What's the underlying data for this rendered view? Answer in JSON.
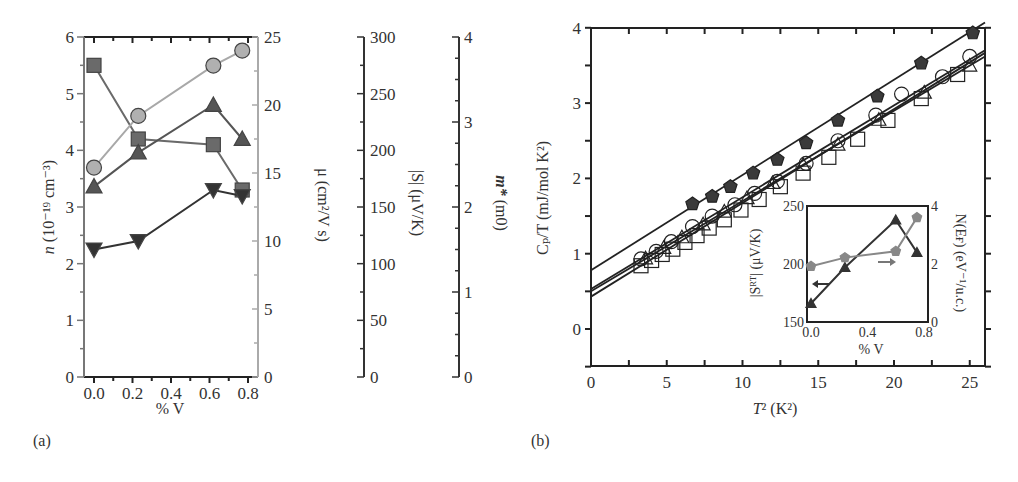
{
  "chart_data": [
    {
      "panel": "(a)",
      "type": "line",
      "xlabel": "% V",
      "x_ticks": [
        "0.0",
        "0.2",
        "0.4",
        "0.6",
        "0.8"
      ],
      "xlim": [
        -0.05,
        0.83
      ],
      "axes": [
        {
          "name": "n",
          "label": "n (10⁻¹⁹ cm⁻³)",
          "ylim": [
            0,
            6
          ],
          "ticks": [
            "0",
            "1",
            "2",
            "3",
            "4",
            "5",
            "6"
          ],
          "color": "#555555"
        },
        {
          "name": "mu",
          "label": "μ (cm²/V s)",
          "ylim": [
            0,
            25
          ],
          "ticks": [
            "0",
            "5",
            "10",
            "15",
            "20",
            "25"
          ],
          "color": "#999999"
        },
        {
          "name": "S",
          "label": "|S| (μV/K)",
          "ylim": [
            0,
            300
          ],
          "ticks": [
            "0",
            "50",
            "100",
            "150",
            "200",
            "250",
            "300"
          ],
          "color": "#333333"
        },
        {
          "name": "m_eff",
          "label": "m* (m0)",
          "ylim": [
            0,
            4
          ],
          "ticks": [
            "0",
            "1",
            "2",
            "3",
            "4"
          ],
          "color": "#333333"
        }
      ],
      "series": [
        {
          "name": "n (squares)",
          "marker": "square",
          "color": "#6a6a6a",
          "axis": "n",
          "x": [
            0.0,
            0.23,
            0.62,
            0.77
          ],
          "values": [
            5.5,
            4.2,
            4.1,
            3.3
          ]
        },
        {
          "name": "mu (circles)",
          "marker": "circle",
          "color": "#a8a8a8",
          "axis": "mu",
          "x": [
            0.0,
            0.23,
            0.62,
            0.77
          ],
          "values": [
            15.4,
            19.2,
            22.9,
            24.0
          ]
        },
        {
          "name": "|S| (up triangles)",
          "marker": "triangle-up",
          "color": "#555555",
          "axis": "S",
          "x": [
            0.0,
            0.23,
            0.62,
            0.77
          ],
          "values": [
            168,
            198,
            240,
            210
          ]
        },
        {
          "name": "m* (down triangles)",
          "marker": "triangle-down",
          "color": "#333333",
          "axis": "m_eff",
          "x": [
            0.0,
            0.23,
            0.62,
            0.77
          ],
          "values": [
            1.5,
            1.6,
            2.2,
            2.13
          ]
        }
      ]
    },
    {
      "panel": "(b)",
      "type": "scatter",
      "xlabel": "T² (K²)",
      "ylabel": "Cₚ/T (mJ/mol K²)",
      "xlim": [
        0,
        26
      ],
      "ylim": [
        -0.5,
        4
      ],
      "x_ticks": [
        "0",
        "5",
        "10",
        "15",
        "20",
        "25"
      ],
      "y_ticks": [
        "0",
        "1",
        "2",
        "3",
        "4"
      ],
      "series": [
        {
          "name": "filled pentagons",
          "marker": "pentagon-filled",
          "color": "#333333",
          "fit": {
            "intercept": 0.78,
            "slope": 0.1265
          },
          "x": [
            6.7,
            8.0,
            9.2,
            10.7,
            12.3,
            14.2,
            16.3,
            18.9,
            21.8,
            25.2
          ],
          "values": [
            1.66,
            1.76,
            1.89,
            2.07,
            2.25,
            2.47,
            2.77,
            3.09,
            3.53,
            3.93
          ]
        },
        {
          "name": "open circles",
          "marker": "circle-open",
          "color": "#222222",
          "fit": {
            "intercept": 0.53,
            "slope": 0.122
          },
          "x": [
            3.3,
            4.3,
            5.3,
            6.7,
            8.0,
            9.5,
            10.8,
            12.3,
            14.2,
            16.3,
            18.8,
            20.5,
            23.2,
            25.0
          ],
          "values": [
            0.93,
            1.03,
            1.16,
            1.36,
            1.5,
            1.65,
            1.8,
            1.96,
            2.2,
            2.5,
            2.84,
            3.12,
            3.35,
            3.62
          ]
        },
        {
          "name": "open triangles",
          "marker": "triangle-open",
          "color": "#222222",
          "fit": {
            "intercept": 0.5,
            "slope": 0.12
          },
          "x": [
            3.6,
            4.8,
            6.0,
            7.4,
            8.8,
            10.3,
            12.0,
            14.0,
            16.3,
            19.0,
            22.0,
            25.0
          ],
          "values": [
            0.94,
            1.08,
            1.22,
            1.39,
            1.56,
            1.74,
            1.94,
            2.18,
            2.45,
            2.78,
            3.14,
            3.5
          ]
        },
        {
          "name": "open squares",
          "marker": "square-open",
          "color": "#222222",
          "fit": {
            "intercept": 0.43,
            "slope": 0.1245
          },
          "x": [
            3.3,
            4.0,
            4.7,
            5.4,
            6.2,
            7.0,
            7.8,
            8.8,
            9.9,
            11.1,
            12.5,
            14.0,
            15.7,
            17.6,
            19.6,
            21.8,
            24.2
          ],
          "values": [
            0.84,
            0.91,
            0.99,
            1.06,
            1.15,
            1.24,
            1.34,
            1.45,
            1.58,
            1.72,
            1.89,
            2.07,
            2.28,
            2.52,
            2.77,
            3.06,
            3.38
          ]
        }
      ],
      "inset": {
        "type": "line",
        "xlabel": "% V",
        "x_ticks": [
          "0.0",
          "0.4",
          "0.8"
        ],
        "xlim": [
          0,
          0.8
        ],
        "left_axis": {
          "label": "|S_RT| (μV/K)",
          "ylim": [
            150,
            250
          ],
          "ticks": [
            "150",
            "200",
            "250"
          ]
        },
        "right_axis": {
          "label": "N(E_F) (eV⁻¹/u.c.)",
          "ylim": [
            0,
            4
          ],
          "ticks": [
            "0",
            "2",
            "4"
          ]
        },
        "series": [
          {
            "name": "|S_RT|",
            "marker": "triangle-filled",
            "color": "#333333",
            "axis": "left",
            "x": [
              0.0,
              0.24,
              0.6,
              0.75
            ],
            "values": [
              166,
              197,
              238,
              210
            ]
          },
          {
            "name": "N(E_F)",
            "marker": "pentagon-filled",
            "color": "#888888",
            "axis": "right",
            "x": [
              0.0,
              0.24,
              0.6,
              0.75
            ],
            "values": [
              1.92,
              2.22,
              2.44,
              3.6
            ]
          }
        ],
        "annotations": [
          "left arrow near |S_RT| series",
          "right arrow near N(E_F) series"
        ]
      }
    }
  ],
  "labels": {
    "a": {
      "panel_label": "(a)",
      "xlabel": "% V",
      "y1_label_italic": "n",
      "y1_label_rest": " (10⁻¹⁹ cm⁻³)",
      "y2_label": "μ (cm²/V s)",
      "y3_label": "|S| (μV/K)",
      "y4_label_italic": "m*",
      "y4_label_rest": " (m0)",
      "x_ticks": [
        "0.0",
        "0.2",
        "0.4",
        "0.6",
        "0.8"
      ],
      "y1_ticks": [
        "0",
        "1",
        "2",
        "3",
        "4",
        "5",
        "6"
      ],
      "y2_ticks": [
        "0",
        "5",
        "10",
        "15",
        "20",
        "25"
      ],
      "y3_ticks": [
        "0",
        "50",
        "100",
        "150",
        "200",
        "250",
        "300"
      ],
      "y4_ticks": [
        "0",
        "1",
        "2",
        "3",
        "4"
      ]
    },
    "b": {
      "panel_label": "(b)",
      "xlabel_italic": "T",
      "xlabel_rest": "² (K²)",
      "ylabel": "Cₚ/T (mJ/mol K²)",
      "x_ticks": [
        "0",
        "5",
        "10",
        "15",
        "20",
        "25"
      ],
      "y_ticks": [
        "0",
        "1",
        "2",
        "3",
        "4"
      ],
      "inset_xlabel": "% V",
      "inset_ylabel_left": "|Sᴿᵀ| (μV/K)",
      "inset_ylabel_right": "N(Eғ) (eV⁻¹/u.c.)",
      "inset_x_ticks": [
        "0.0",
        "0.4",
        "0.8"
      ],
      "inset_left_ticks": [
        "150",
        "200",
        "250"
      ],
      "inset_right_ticks": [
        "0",
        "2",
        "4"
      ]
    }
  }
}
